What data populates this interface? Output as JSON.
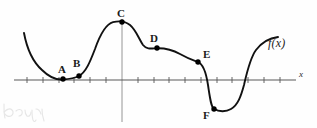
{
  "figure": {
    "kind": "math-graph",
    "function_label": "f(x)",
    "axis_x_label": "x",
    "colors": {
      "curve": "#111111",
      "axis": "#555555",
      "y_axis": "#8a8a8a",
      "point": "#000000",
      "label": "#1a1a1a",
      "background": "#fefefe",
      "scribble": "#b8b8b8"
    },
    "axes": {
      "x_axis_y": 80,
      "x_axis_x_start": 14,
      "x_axis_x_end": 296,
      "y_axis_x": 122,
      "y_axis_y_top": 19,
      "y_axis_y_bottom": 122,
      "tick_spacing": 15.8,
      "tick_half_height": 3,
      "grid": false,
      "tick_labels": []
    },
    "points": [
      {
        "name": "A",
        "px": 63,
        "py": 79,
        "label_x": 58,
        "label_y": 64
      },
      {
        "name": "B",
        "px": 79,
        "py": 76,
        "label_x": 73,
        "label_y": 58
      },
      {
        "name": "C",
        "px": 122,
        "py": 22,
        "label_x": 117,
        "label_y": 8
      },
      {
        "name": "D",
        "px": 157,
        "py": 48,
        "label_x": 150,
        "label_y": 33
      },
      {
        "name": "E",
        "px": 198,
        "py": 62,
        "label_x": 203,
        "label_y": 49
      },
      {
        "name": "F",
        "px": 214,
        "py": 109,
        "label_x": 203,
        "label_y": 110
      }
    ],
    "function_label_pos": {
      "x": 268,
      "y": 37
    },
    "axis_x_label_pos": {
      "x": 299,
      "y": 70
    },
    "curve_path": "M 24,33 C 27,49 33,62 42,70 C 50,78 57,80 63,79.5 C 70,79 75,78 79,76 C 86,72 90,62 95,49 C 100,35 106,24 113,22.2 C 119,20.7 125,21 130,25 C 136,30 139,39 143,45 C 147,50 152,48.4 157,48.2 C 166,48 173,50 180,54 C 187,58 192,60 198,62.2 C 203,64 206,72 208,85 C 210,98 211,107 214,108.8 C 219,112 226,112 231,109 C 238,105 241,96 244,85 C 247,72 250,58 256,50 C 262,42 270,38 278,37",
    "scribble_paths": [
      "M 3,6 C 3,12 3,17 4,20",
      "M 3,14 C 6,11 9,10 11,12 C 13,14 12,17 10,18 C 8,19 5,18 4,16",
      "M 15,13 C 17,11 20,11 21,13 C 22,16 20,18 18,18",
      "M 24,12 C 24,15 25,17 26,18 C 28,19 30,17 30,14",
      "M 31,12 C 31,16 31,19 32,22 C 33,24 34,24 35,22",
      "M 35,11 C 37,11 39,13 40,16",
      "M 41,11 C 41,16 42,20 43,23"
    ]
  }
}
